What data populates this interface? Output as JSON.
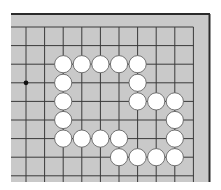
{
  "board": {
    "colors": {
      "board": "#c9c9c9",
      "lines": "#3a3a3a",
      "frame": "#2b2b2b",
      "white_stone": "#ffffff",
      "stone_outline": "#555555",
      "star_point": "#111111"
    },
    "visible_columns": 10,
    "visible_rows": 9,
    "edges_shown": [
      "top",
      "right"
    ],
    "star_points": [
      {
        "col": 0,
        "row": 3
      }
    ],
    "stones": [
      {
        "color": "white",
        "col": 2,
        "row": 2
      },
      {
        "color": "white",
        "col": 3,
        "row": 2
      },
      {
        "color": "white",
        "col": 4,
        "row": 2
      },
      {
        "color": "white",
        "col": 5,
        "row": 2
      },
      {
        "color": "white",
        "col": 6,
        "row": 2
      },
      {
        "color": "white",
        "col": 2,
        "row": 3
      },
      {
        "color": "white",
        "col": 6,
        "row": 3
      },
      {
        "color": "white",
        "col": 2,
        "row": 4
      },
      {
        "color": "white",
        "col": 6,
        "row": 4
      },
      {
        "color": "white",
        "col": 7,
        "row": 4
      },
      {
        "color": "white",
        "col": 8,
        "row": 4
      },
      {
        "color": "white",
        "col": 2,
        "row": 5
      },
      {
        "color": "white",
        "col": 8,
        "row": 5
      },
      {
        "color": "white",
        "col": 2,
        "row": 6
      },
      {
        "color": "white",
        "col": 3,
        "row": 6
      },
      {
        "color": "white",
        "col": 4,
        "row": 6
      },
      {
        "color": "white",
        "col": 5,
        "row": 6
      },
      {
        "color": "white",
        "col": 8,
        "row": 6
      },
      {
        "color": "white",
        "col": 5,
        "row": 7
      },
      {
        "color": "white",
        "col": 6,
        "row": 7
      },
      {
        "color": "white",
        "col": 7,
        "row": 7
      },
      {
        "color": "white",
        "col": 8,
        "row": 7
      }
    ]
  }
}
